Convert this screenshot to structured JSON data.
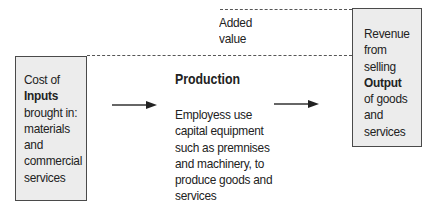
{
  "diagram": {
    "inputs_box": {
      "lines": [
        {
          "text": "Cost of",
          "bold": false
        },
        {
          "text": "Inputs",
          "bold": true
        },
        {
          "text": "brought in:",
          "bold": false
        },
        {
          "text": "materials",
          "bold": false
        },
        {
          "text": "and",
          "bold": false
        },
        {
          "text": "commercial",
          "bold": false
        },
        {
          "text": "services",
          "bold": false
        }
      ]
    },
    "added_value": {
      "lines": [
        "Added",
        "value"
      ]
    },
    "production": {
      "title": "Production",
      "lines": [
        "Employess use",
        "capital equipment",
        "such as premnises",
        "and machinery, to",
        "produce goods and",
        "services"
      ]
    },
    "output_box": {
      "lines": [
        {
          "text": "Revenue",
          "bold": false
        },
        {
          "text": "from",
          "bold": false
        },
        {
          "text": "selling",
          "bold": false
        },
        {
          "text": "Output",
          "bold": true
        },
        {
          "text": "of goods",
          "bold": false
        },
        {
          "text": "and",
          "bold": false
        },
        {
          "text": "services",
          "bold": false
        }
      ]
    },
    "icons": {
      "arrow_1": "right-arrow-icon",
      "arrow_2": "right-arrow-icon"
    },
    "colors": {
      "box_fill": "#ececec",
      "box_border": "#4a4a4a",
      "text": "#222222",
      "dashed_line": "#555555"
    }
  }
}
